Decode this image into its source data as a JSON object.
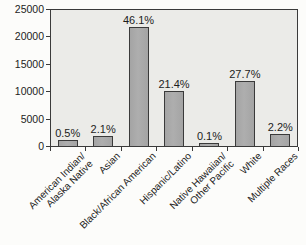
{
  "chart_data": {
    "type": "bar",
    "title": "",
    "xlabel": "",
    "ylabel": "",
    "categories": [
      "American Indian/\nAlaska Native",
      "Asian",
      "Black/African American",
      "Hispanic/Latino",
      "Native Hawaiian/\nOther Pacific",
      "White",
      "Multiple Races"
    ],
    "values": [
      1100,
      1900,
      21700,
      10000,
      550,
      11800,
      2100
    ],
    "bar_labels": [
      "0.5%",
      "2.1%",
      "46.1%",
      "21.4%",
      "0.1%",
      "27.7%",
      "2.2%"
    ],
    "ylim": [
      0,
      25000
    ],
    "yticks": [
      0,
      5000,
      10000,
      15000,
      20000,
      25000
    ],
    "grid": false,
    "legend": false,
    "bar_color": "#a4a4a4",
    "bar_border_color": "#3a3a3a",
    "plot_background": "#ebebe8",
    "axis_color": "#3a3a3a",
    "text_color": "#1c1c1c"
  }
}
